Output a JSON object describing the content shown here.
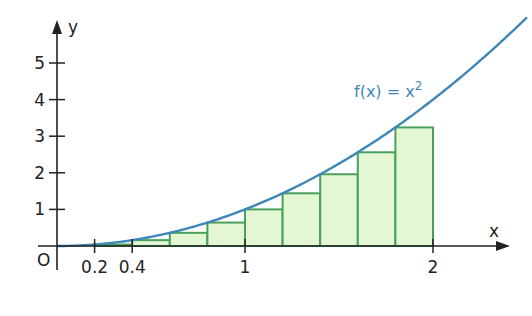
{
  "chart_data": {
    "type": "area",
    "title": "",
    "function_label": "f(x) = x",
    "function_exponent": "2",
    "xlabel": "x",
    "ylabel": "y",
    "origin_label": "O",
    "x_ticks": [
      {
        "value": 0.2,
        "label": "0.2"
      },
      {
        "value": 0.4,
        "label": "0.4"
      },
      {
        "value": 1,
        "label": "1"
      },
      {
        "value": 2,
        "label": "2"
      }
    ],
    "y_ticks": [
      {
        "value": 1,
        "label": "1"
      },
      {
        "value": 2,
        "label": "2"
      },
      {
        "value": 3,
        "label": "3"
      },
      {
        "value": 4,
        "label": "4"
      },
      {
        "value": 5,
        "label": "5"
      }
    ],
    "xlim": [
      0,
      2.5
    ],
    "ylim": [
      0,
      5.5
    ],
    "curve": {
      "name": "f(x) = x^2",
      "color": "#3d86b8",
      "x_range": [
        0,
        2.5
      ]
    },
    "rectangles": {
      "description": "Lower Riemann sum (left endpoints) on [0.2, 2] with width 0.2",
      "fill": "#e4f7d4",
      "stroke": "#4aa05a",
      "x_left": [
        0.2,
        0.4,
        0.6,
        0.8,
        1.0,
        1.2,
        1.4,
        1.6,
        1.8
      ],
      "width": 0.2,
      "heights": [
        0.04,
        0.16,
        0.36,
        0.64,
        1.0,
        1.44,
        1.96,
        2.56,
        3.24
      ]
    },
    "grid": false
  }
}
